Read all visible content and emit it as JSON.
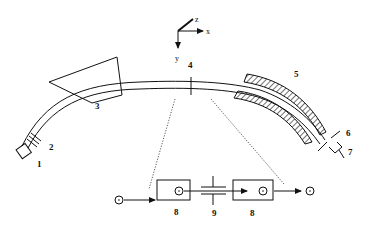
{
  "diagram": {
    "type": "beamline-schematic",
    "axes": {
      "x": "x",
      "y": "y",
      "z": "z"
    },
    "labels": {
      "l1": "1",
      "l2": "2",
      "l3": "3",
      "l4": "4",
      "l5": "5",
      "l6": "6",
      "l7": "7",
      "l8a": "8",
      "l8b": "8",
      "l9": "9"
    },
    "components": [
      {
        "id": "1",
        "shape": "square-source"
      },
      {
        "id": "2",
        "shape": "grid-plates"
      },
      {
        "id": "3",
        "shape": "magnet-polygon"
      },
      {
        "id": "4",
        "shape": "focal-marker"
      },
      {
        "id": "5",
        "shape": "hatched-electrostatic-analyzer"
      },
      {
        "id": "6",
        "shape": "slit"
      },
      {
        "id": "7",
        "shape": "detector"
      },
      {
        "id": "8",
        "shape": "rectangle-electrode"
      },
      {
        "id": "9",
        "shape": "capacitor-gap"
      }
    ],
    "ion_symbol": "⊙"
  }
}
